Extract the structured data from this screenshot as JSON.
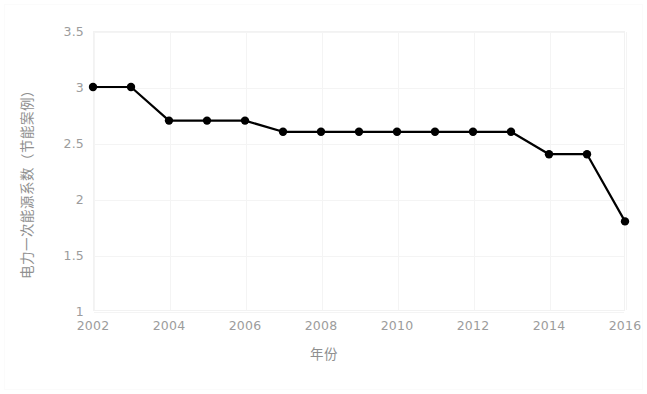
{
  "chart_data": {
    "type": "line",
    "title": "",
    "xlabel": "年份",
    "ylabel": "电力一次能源系数（节能案例）",
    "x": [
      2002,
      2003,
      2004,
      2005,
      2006,
      2007,
      2008,
      2009,
      2010,
      2011,
      2012,
      2013,
      2014,
      2015,
      2016
    ],
    "values": [
      3.0,
      3.0,
      2.7,
      2.7,
      2.7,
      2.6,
      2.6,
      2.6,
      2.6,
      2.6,
      2.6,
      2.6,
      2.4,
      2.4,
      1.8
    ],
    "series": [
      {
        "name": "电力一次能源系数（节能案例）",
        "values": [
          3.0,
          3.0,
          2.7,
          2.7,
          2.7,
          2.6,
          2.6,
          2.6,
          2.6,
          2.6,
          2.6,
          2.6,
          2.4,
          2.4,
          1.8
        ]
      }
    ],
    "xlim": [
      2002,
      2016
    ],
    "ylim": [
      1,
      3.5
    ],
    "xticks": [
      "2002",
      "2004",
      "2006",
      "2008",
      "2010",
      "2012",
      "2014",
      "2016"
    ],
    "xtick_values": [
      2002,
      2004,
      2006,
      2008,
      2010,
      2012,
      2014,
      2016
    ],
    "yticks": [
      "1",
      "1.5",
      "2",
      "2.5",
      "3",
      "3.5"
    ],
    "ytick_values": [
      1,
      1.5,
      2,
      2.5,
      3,
      3.5
    ],
    "grid": true,
    "legend": false,
    "legend_position": "none",
    "line_color": "#000000",
    "marker": "circle",
    "marker_color": "#000000",
    "background_color": "#ffffff",
    "grid_color": "#f4f4f4",
    "tick_label_color": "#9c9c9c",
    "axis_label_color": "#8f8f8f"
  }
}
